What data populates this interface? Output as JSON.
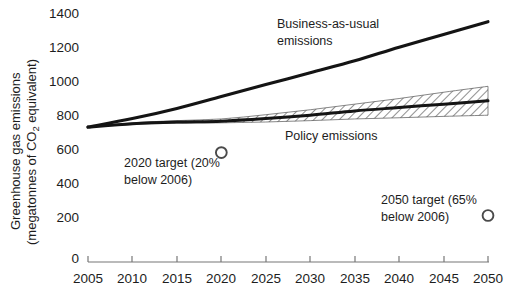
{
  "chart_data": {
    "type": "line",
    "title": "",
    "xlabel": "",
    "ylabel": "Greenhouse gas emissions (megatonnes of CO2 equivalent)",
    "ylabel_line1": "Greenhouse gas emissions",
    "ylabel_line2_pre": "(megatonnes of CO",
    "ylabel_line2_sub": "2",
    "ylabel_line2_post": " equivalent)",
    "xlim": [
      2005,
      2050
    ],
    "ylim": [
      0,
      1400
    ],
    "grid": false,
    "legend_position": "inline-annotations",
    "xticks": [
      2005,
      2010,
      2015,
      2020,
      2025,
      2030,
      2035,
      2040,
      2045,
      2050
    ],
    "xtick_labels": [
      "2005",
      "2010",
      "2015",
      "2020",
      "2025",
      "2030",
      "2035",
      "2040",
      "2045",
      "2050"
    ],
    "yticks": [
      0,
      200,
      400,
      600,
      800,
      1000,
      1200,
      1400
    ],
    "ytick_labels": [
      "0",
      "200",
      "400",
      "600",
      "800",
      "1000",
      "1200",
      "1400"
    ],
    "x": [
      2005,
      2010,
      2015,
      2020,
      2025,
      2030,
      2035,
      2040,
      2045,
      2050
    ],
    "series": [
      {
        "name": "Business-as-usual emissions",
        "label": "Business-as-usual emissions",
        "label_line1": "Business-as-usual",
        "label_line2": "emissions",
        "color": "#1a1a1a",
        "values": [
          770,
          820,
          880,
          950,
          1020,
          1090,
          1160,
          1240,
          1315,
          1390
        ]
      },
      {
        "name": "Policy emissions",
        "label": "Policy emissions",
        "color": "#1a1a1a",
        "values": [
          770,
          790,
          800,
          805,
          820,
          840,
          865,
          885,
          905,
          925
        ],
        "band_low": [
          770,
          785,
          793,
          795,
          800,
          808,
          818,
          825,
          833,
          840
        ],
        "band_high": [
          770,
          795,
          808,
          818,
          843,
          872,
          905,
          938,
          975,
          1010
        ],
        "band_style": "hatched"
      }
    ],
    "markers": [
      {
        "name": "2020 target",
        "label": "2020 target (20% below 2006)",
        "label_line1": "2020 target (20%",
        "label_line2": "below 2006)",
        "x": 2020,
        "y": 620,
        "shape": "circle-open",
        "color": "#4a4a4a"
      },
      {
        "name": "2050 target",
        "label": "2050 target (65% below 2006)",
        "label_line1": "2050 target (65%",
        "label_line2": "below 2006)",
        "x": 2050,
        "y": 250,
        "shape": "circle-open",
        "color": "#4a4a4a"
      }
    ]
  }
}
